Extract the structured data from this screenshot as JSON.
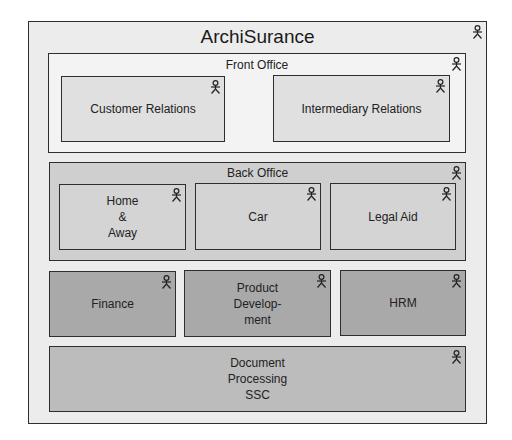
{
  "diagram": {
    "title": "ArchiSurance",
    "colors": {
      "outer_fill": "#ececec",
      "front_office_fill": "#f3f3f3",
      "front_office_child_fill": "#e0e0e0",
      "back_office_fill": "#cfcfcf",
      "back_office_child_fill": "#d4d4d4",
      "shared_dept_fill": "#a9a9a9",
      "ssc_fill": "#bcbcbc",
      "border": "#2e2e2e"
    },
    "front_office": {
      "label": "Front Office",
      "children": [
        {
          "label": "Customer Relations"
        },
        {
          "label": "Intermediary Relations"
        }
      ]
    },
    "back_office": {
      "label": "Back Office",
      "children": [
        {
          "label": "Home\n&\nAway"
        },
        {
          "label": "Car"
        },
        {
          "label": "Legal Aid"
        }
      ]
    },
    "departments": [
      {
        "label": "Finance"
      },
      {
        "label": "Product\nDevelop-\nment"
      },
      {
        "label": "HRM"
      }
    ],
    "shared_service": {
      "label": "Document\nProcessing\nSSC"
    },
    "element_icon": "business-actor-icon"
  }
}
